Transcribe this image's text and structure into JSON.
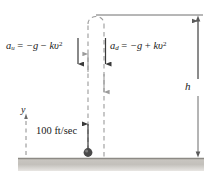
{
  "figure": {
    "background_color": "#ffffff",
    "ink_color": "#1a1a1a",
    "dash_color": "#9b9b9b",
    "ground_color": "#b9b6b1",
    "ball_color": "#4a4a4a"
  },
  "labels": {
    "accel_up": {
      "var": "a",
      "sub": "u",
      "equals": " = ",
      "term1": "−g",
      "op": " − ",
      "term2": "kυ",
      "exp": "2",
      "full": "a_u = -g - kυ²"
    },
    "accel_down": {
      "var": "a",
      "sub": "d",
      "equals": " = ",
      "term1": "−g",
      "op": " + ",
      "term2": "kυ",
      "exp": "2",
      "full": "a_d = -g + kυ²"
    },
    "height": "h",
    "axis_y": "y",
    "initial_speed": "100 ft/sec"
  },
  "geometry": {
    "ground_y": 158,
    "apex_y": 15,
    "ball_x": 88,
    "ball_y": 152,
    "up_path_x": 88,
    "down_path_x": 104,
    "dimension_x": 198,
    "y_axis_x": 26
  }
}
